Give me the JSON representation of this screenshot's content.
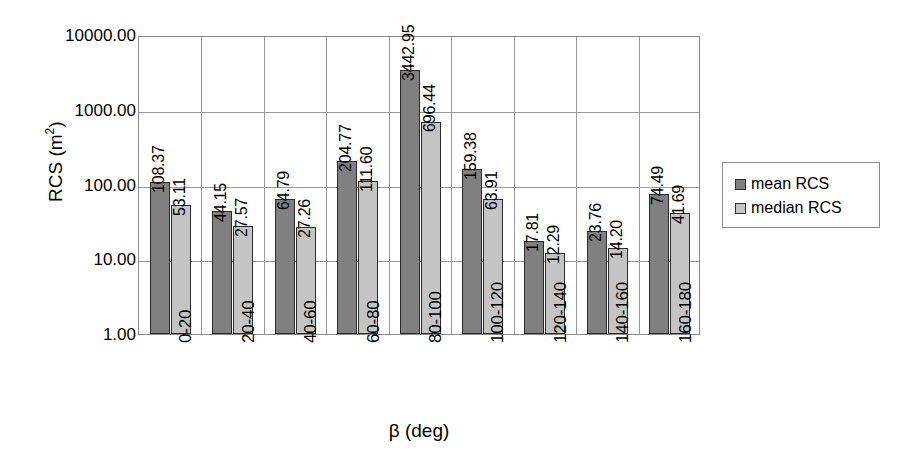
{
  "chart_data": {
    "type": "bar",
    "title": "",
    "xlabel": "β (deg)",
    "ylabel": "RCS (m²)",
    "ylabel_base": "RCS (m",
    "ylabel_sup": "2",
    "ylabel_tail": ")",
    "yscale": "log",
    "ylim": [
      1.0,
      10000.0
    ],
    "ytick_labels": [
      "10000.00",
      "1000.00",
      "100.00",
      "10.00",
      "1.00"
    ],
    "ytick_values": [
      10000.0,
      1000.0,
      100.0,
      10.0,
      1.0
    ],
    "grid": true,
    "legend_position": "right",
    "categories": [
      "0-20",
      "20-40",
      "40-60",
      "60-80",
      "80-100",
      "100-120",
      "120-140",
      "140-160",
      "160-180"
    ],
    "series": [
      {
        "name": "mean RCS",
        "color": "#808080",
        "values": [
          108.37,
          44.15,
          64.79,
          204.77,
          3442.95,
          159.38,
          17.81,
          23.76,
          74.49
        ],
        "labels": [
          "108.37",
          "44.15",
          "64.79",
          "204.77",
          "3442.95",
          "159.38",
          "17.81",
          "23.76",
          "74.49"
        ]
      },
      {
        "name": "median RCS",
        "color": "#c4c4c4",
        "values": [
          53.11,
          27.57,
          27.26,
          111.6,
          696.44,
          63.91,
          12.29,
          14.2,
          41.69
        ],
        "labels": [
          "53.11",
          "27.57",
          "27.26",
          "111.60",
          "696.44",
          "63.91",
          "12.29",
          "14.20",
          "41.69"
        ]
      }
    ]
  },
  "legend": {
    "items": [
      {
        "label": "mean RCS",
        "swatch": "mean"
      },
      {
        "label": "median RCS",
        "swatch": "median"
      }
    ]
  }
}
